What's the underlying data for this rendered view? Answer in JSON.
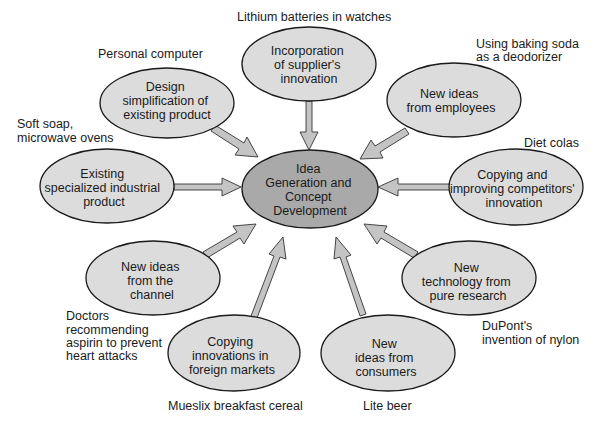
{
  "diagram": {
    "type": "hub-and-spoke",
    "center": {
      "lines": [
        "Idea",
        "Generation and",
        "Concept",
        "Development"
      ],
      "fill": "#a9a9a9"
    },
    "node_fill": "#dcdcdc",
    "arrow_fill": "#c4c4c4",
    "nodes": [
      {
        "id": "supplier",
        "lines": [
          "Incorporation",
          "of supplier's",
          "innovation"
        ],
        "example": [
          "Lithium batteries in watches"
        ]
      },
      {
        "id": "employees",
        "lines": [
          "New ideas",
          "from employees"
        ],
        "example": [
          "Using baking soda",
          "as a deodorizer"
        ]
      },
      {
        "id": "competitors",
        "lines": [
          "Copying and",
          "improving competitors'",
          "innovation"
        ],
        "example": [
          "Diet colas"
        ]
      },
      {
        "id": "research",
        "lines": [
          "New",
          "technology from",
          "pure research"
        ],
        "example": [
          "DuPont's",
          "invention of nylon"
        ]
      },
      {
        "id": "consumers",
        "lines": [
          "New",
          "ideas from",
          "consumers"
        ],
        "example": [
          "Lite beer"
        ]
      },
      {
        "id": "foreign",
        "lines": [
          "Copying",
          "innovations in",
          "foreign markets"
        ],
        "example": [
          "Mueslix breakfast cereal"
        ]
      },
      {
        "id": "channel",
        "lines": [
          "New ideas",
          "from the",
          "channel"
        ],
        "example": [
          "Doctors",
          "recommending",
          "aspirin to prevent",
          "heart attacks"
        ]
      },
      {
        "id": "industrial",
        "lines": [
          "Existing",
          "specialized industrial",
          "product"
        ],
        "example": [
          "Soft soap,",
          "microwave ovens"
        ]
      },
      {
        "id": "design",
        "lines": [
          "Design",
          "simplification of",
          "existing product"
        ],
        "example": [
          "Personal computer"
        ]
      }
    ]
  }
}
